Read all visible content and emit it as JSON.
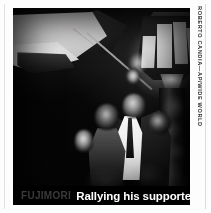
{
  "photo": {
    "alt_description": "Night-time black-and-white news photograph: a man in a white shirt and dark suit stands beneath a glowing ornate street lamp while a supporter raises a hand beside him; a pale flag on a pole is waved in the upper left.",
    "subjects": [
      "waved-flag",
      "flag-pole",
      "ornate-street-lamp",
      "man-in-white-shirt",
      "woman-with-raised-hand",
      "crowd"
    ]
  },
  "caption": {
    "kicker": "FUJIMORI",
    "title": "Rallying his supporters"
  },
  "credit": {
    "text": "ROBERTO CANDIA—AP/WIDE WORLD"
  },
  "colors": {
    "page_background": "#fdfdfd",
    "photo_black": "#050505",
    "caption_bar": "#000000",
    "caption_kicker": "#3b3b3b",
    "caption_title": "#ffffff",
    "credit_text": "#2e2e2e",
    "rule": "#e2e2e2"
  }
}
